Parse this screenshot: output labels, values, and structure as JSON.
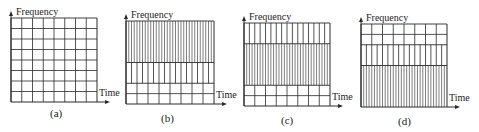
{
  "axis_labels": {
    "y": "Frequency",
    "x": "Time"
  },
  "line_color": "#2a2a2a",
  "panels": [
    {
      "id": "a",
      "caption": "(a)",
      "x": 11,
      "y": 18,
      "w": 86,
      "h": 84,
      "cap_x": 50,
      "cap_y": 107,
      "bands": [
        {
          "frac": 1.0,
          "type": "grid",
          "cols": 8,
          "rows": 8
        }
      ]
    },
    {
      "id": "b",
      "caption": "(b)",
      "x": 126,
      "y": 21,
      "w": 88,
      "h": 83,
      "cap_x": 161,
      "cap_y": 112,
      "bands": [
        {
          "frac": 0.5,
          "type": "vlines",
          "cols": 32
        },
        {
          "frac": 0.25,
          "type": "vlines",
          "cols": 16
        },
        {
          "frac": 0.25,
          "type": "grid",
          "cols": 8,
          "rows": 2
        }
      ]
    },
    {
      "id": "c",
      "caption": "(c)",
      "x": 244,
      "y": 23,
      "w": 86,
      "h": 83,
      "cap_x": 281,
      "cap_y": 114,
      "bands": [
        {
          "frac": 0.25,
          "type": "vlines",
          "cols": 16
        },
        {
          "frac": 0.5,
          "type": "vlines",
          "cols": 32
        },
        {
          "frac": 0.25,
          "type": "grid",
          "cols": 8,
          "rows": 2
        }
      ]
    },
    {
      "id": "d",
      "caption": "(d)",
      "x": 361,
      "y": 24,
      "w": 86,
      "h": 83,
      "cap_x": 398,
      "cap_y": 115,
      "bands": [
        {
          "frac": 0.25,
          "type": "grid",
          "cols": 8,
          "rows": 2
        },
        {
          "frac": 0.25,
          "type": "vlines",
          "cols": 16
        },
        {
          "frac": 0.5,
          "type": "vlines",
          "cols": 32
        }
      ]
    }
  ]
}
